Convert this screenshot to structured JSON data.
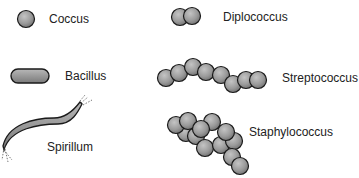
{
  "diagram": {
    "items": [
      {
        "name": "coccus",
        "label": "Coccus",
        "icon": "single-sphere-icon"
      },
      {
        "name": "diplococcus",
        "label": "Diplococcus",
        "icon": "paired-spheres-icon"
      },
      {
        "name": "bacillus",
        "label": "Bacillus",
        "icon": "rod-icon"
      },
      {
        "name": "streptococcus",
        "label": "Streptococcus",
        "icon": "chain-spheres-icon"
      },
      {
        "name": "spirillum",
        "label": "Spirillum",
        "icon": "spiral-rod-icon"
      },
      {
        "name": "staphylococcus",
        "label": "Staphylococcus",
        "icon": "cluster-spheres-icon"
      }
    ],
    "colors": {
      "cell_fill": "#9a9a9a",
      "cell_stroke": "#1a1a1a",
      "text": "#222222",
      "background": "#ffffff"
    }
  }
}
